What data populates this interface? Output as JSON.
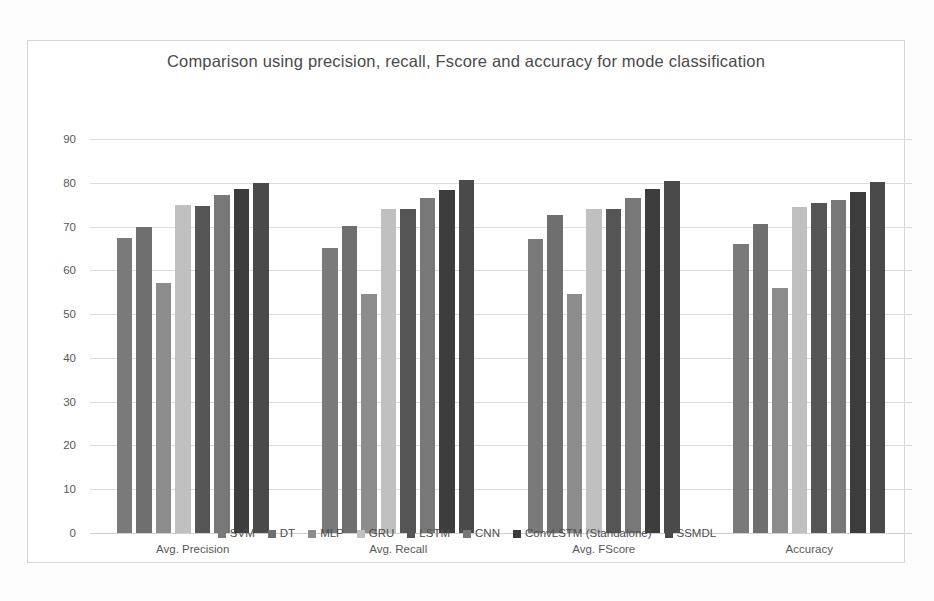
{
  "chart_data": {
    "type": "bar",
    "title": "Comparison using precision, recall, Fscore and accuracy for mode classification",
    "xlabel": "",
    "ylabel": "",
    "ylim": [
      0,
      90
    ],
    "ytick_step": 10,
    "yticks": [
      "90",
      "80",
      "70",
      "60",
      "50",
      "40",
      "30",
      "20",
      "10",
      "0"
    ],
    "grid": true,
    "legend_position": "bottom",
    "categories": [
      "Avg. Precision",
      "Avg. Recall",
      "Avg. FScore",
      "Accuracy"
    ],
    "series": [
      {
        "name": "SVM",
        "color": "#7a7a7a",
        "values": [
          67.5,
          65.0,
          67.2,
          66.0
        ]
      },
      {
        "name": "DT",
        "color": "#6f6f6f",
        "values": [
          69.8,
          70.2,
          72.6,
          70.5
        ]
      },
      {
        "name": "MLP",
        "color": "#8c8c8c",
        "values": [
          57.0,
          54.5,
          54.6,
          56.0
        ]
      },
      {
        "name": "GRU",
        "color": "#c0c0c0",
        "values": [
          75.0,
          73.9,
          73.9,
          74.5
        ]
      },
      {
        "name": "LSTM",
        "color": "#555555",
        "values": [
          74.8,
          74.0,
          74.0,
          75.4
        ]
      },
      {
        "name": "CNN",
        "color": "#787878",
        "values": [
          77.3,
          76.5,
          76.6,
          76.0
        ]
      },
      {
        "name": "ConvLSTM (Standalone)",
        "color": "#3c3c3c",
        "values": [
          78.5,
          78.4,
          78.5,
          78.0
        ]
      },
      {
        "name": "SSMDL",
        "color": "#4a4a4a",
        "values": [
          80.0,
          80.6,
          80.5,
          80.2
        ]
      }
    ]
  }
}
